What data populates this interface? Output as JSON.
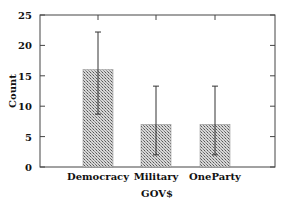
{
  "chart_data": {
    "type": "bar",
    "title": "",
    "xlabel": "GOV$",
    "ylabel": "Count",
    "categories": [
      "Democracy",
      "Military",
      "OneParty"
    ],
    "values": [
      16,
      7,
      7
    ],
    "error_bars": {
      "lower": [
        8.7,
        2,
        2
      ],
      "upper": [
        22.2,
        13.3,
        13.3
      ]
    },
    "ylim": [
      0,
      25
    ],
    "yticks": [
      0,
      5,
      10,
      15,
      20,
      25
    ],
    "grid": false,
    "legend": null,
    "bar_fill": "crosshatch gray",
    "colors": {
      "bar": "#9a9a9a",
      "axis": "#444444",
      "error": "#333333"
    }
  }
}
